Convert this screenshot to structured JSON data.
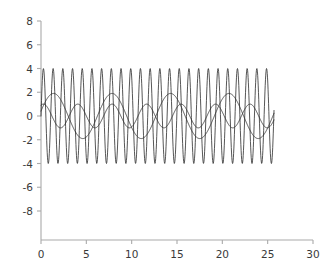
{
  "chart_data": {
    "type": "line",
    "title": "",
    "subtitle": "",
    "xlabel": "",
    "ylabel": "",
    "xlim": [
      0,
      30
    ],
    "ylim": [
      -8,
      8
    ],
    "xticks": [
      0,
      5,
      10,
      15,
      20,
      25,
      30
    ],
    "yticks": [
      -8,
      -6,
      -4,
      -2,
      0,
      2,
      4,
      6,
      8
    ],
    "xtick_labels": [
      "0",
      "5",
      "10",
      "15",
      "20",
      "25",
      "30"
    ],
    "ytick_labels": [
      "-8",
      "-6",
      "-4",
      "-2",
      "0",
      "2",
      "4",
      "6",
      "8"
    ],
    "grid": false,
    "legend": false,
    "legend_position": "none",
    "annotations": [],
    "x_start": 0.0,
    "x_end": 25.7,
    "samples": 900,
    "line_color": "#2b2b2b",
    "line_width": 0.8,
    "axis_color": "#aaaaaa",
    "tick_label_color": "#3a3a3a",
    "background": "#ffffff",
    "series": [
      {
        "name": "fast-oscillation",
        "waveform": "sine",
        "amplitude": 4.0,
        "period": 1.07,
        "phase": 0.0,
        "offset": 0.0
      },
      {
        "name": "medium-oscillation",
        "waveform": "sine",
        "amplitude": 1.0,
        "period": 3.8,
        "phase": 1.15,
        "offset": 0.0
      },
      {
        "name": "slow-oscillation",
        "waveform": "sine",
        "amplitude": 1.9,
        "period": 6.45,
        "phase": 0.22,
        "offset": 0.0
      }
    ]
  }
}
